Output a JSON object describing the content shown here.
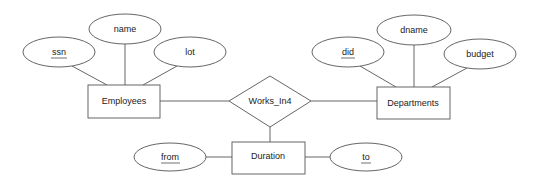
{
  "diagram": {
    "type": "ER diagram",
    "entities": [
      {
        "id": "employees",
        "label": "Employees",
        "attributes": [
          "ssn",
          "name",
          "lot"
        ],
        "key": [
          "ssn"
        ]
      },
      {
        "id": "departments",
        "label": "Departments",
        "attributes": [
          "did",
          "dname",
          "budget"
        ],
        "key": [
          "did"
        ]
      },
      {
        "id": "duration",
        "label": "Duration",
        "attributes": [
          "from",
          "to"
        ],
        "key": [
          "from",
          "to"
        ]
      }
    ],
    "relationships": [
      {
        "id": "works_in4",
        "label": "Works_In4",
        "connects": [
          "employees",
          "departments",
          "duration"
        ]
      }
    ],
    "attributes": {
      "ssn": {
        "label": "ssn",
        "key": true
      },
      "name": {
        "label": "name",
        "key": false
      },
      "lot": {
        "label": "lot",
        "key": false
      },
      "did": {
        "label": "did",
        "key": true
      },
      "dname": {
        "label": "dname",
        "key": false
      },
      "budget": {
        "label": "budget",
        "key": false
      },
      "from": {
        "label": "from",
        "key": true
      },
      "to": {
        "label": "to",
        "key": true
      }
    },
    "labels": {
      "employees": "Employees",
      "departments": "Departments",
      "duration": "Duration",
      "works_in4": "Works_In4"
    }
  }
}
